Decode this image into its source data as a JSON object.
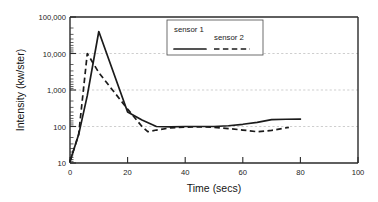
{
  "chart_data": {
    "type": "line",
    "title": "",
    "xlabel": "Time (secs)",
    "ylabel": "Intensity (kw/ster)",
    "xlim": [
      0,
      100
    ],
    "ylim": [
      10,
      100000
    ],
    "yscale": "log",
    "xscale": "linear",
    "grid": "horizontal-dotted-at-decades",
    "legend_position": "top-center",
    "xticks": [
      0,
      20,
      40,
      60,
      80,
      100
    ],
    "xtick_labels": [
      "0",
      "20",
      "40",
      "60",
      "80",
      "100"
    ],
    "yticks": [
      10,
      100,
      1000,
      10000,
      100000
    ],
    "ytick_labels": [
      "10",
      "100",
      "1,000",
      "10,000",
      "100,000"
    ],
    "series": [
      {
        "name": "sensor 1",
        "style": "solid",
        "color": "#1b1b1b",
        "x": [
          0,
          3,
          6,
          10,
          20,
          25,
          30,
          35,
          40,
          45,
          50,
          55,
          60,
          65,
          70,
          75,
          80
        ],
        "y": [
          11,
          60,
          700,
          40000,
          250,
          150,
          100,
          98,
          100,
          100,
          100,
          105,
          115,
          130,
          155,
          158,
          160
        ]
      },
      {
        "name": "sensor 2",
        "style": "dashed",
        "color": "#1b1b1b",
        "x": [
          0,
          3,
          6,
          10,
          20,
          25,
          27,
          30,
          35,
          40,
          45,
          50,
          55,
          60,
          65,
          70,
          76
        ],
        "y": [
          11,
          60,
          10000,
          3000,
          300,
          100,
          72,
          80,
          92,
          96,
          98,
          95,
          88,
          80,
          72,
          78,
          95
        ]
      }
    ]
  }
}
